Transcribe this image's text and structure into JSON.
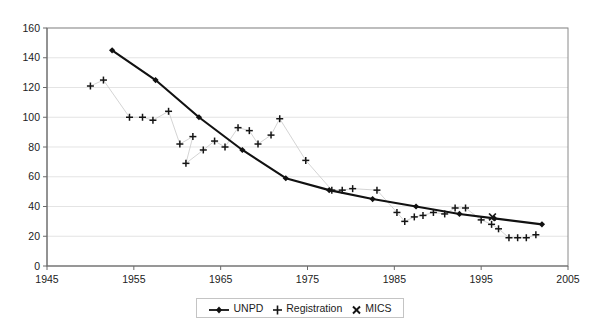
{
  "chart_data": {
    "type": "line",
    "title": "",
    "subtitle": "",
    "xlabel": "",
    "ylabel": "",
    "xlim": [
      1945,
      2005
    ],
    "ylim": [
      0,
      160
    ],
    "xticks": [
      1945,
      1955,
      1965,
      1975,
      1985,
      1995,
      2005
    ],
    "yticks": [
      0,
      20,
      40,
      60,
      80,
      100,
      120,
      140,
      160
    ],
    "grid": "horizontal",
    "legend_position": "bottom-center",
    "legend": [
      "UNPD",
      "Registration",
      "MICS"
    ],
    "series": [
      {
        "name": "UNPD",
        "marker": "diamond",
        "line": "solid-thick-black",
        "points": [
          {
            "x": 1952.5,
            "y": 145
          },
          {
            "x": 1957.5,
            "y": 125
          },
          {
            "x": 1962.5,
            "y": 100
          },
          {
            "x": 1967.5,
            "y": 78
          },
          {
            "x": 1972.5,
            "y": 59
          },
          {
            "x": 1977.5,
            "y": 51
          },
          {
            "x": 1982.5,
            "y": 45
          },
          {
            "x": 1987.5,
            "y": 40
          },
          {
            "x": 1992.5,
            "y": 35
          },
          {
            "x": 1996.5,
            "y": 32
          },
          {
            "x": 2002.0,
            "y": 28
          }
        ]
      },
      {
        "name": "Registration",
        "marker": "plus",
        "line": "solid-thin-grey",
        "points": [
          {
            "x": 1950.0,
            "y": 121
          },
          {
            "x": 1951.5,
            "y": 125
          },
          {
            "x": 1954.5,
            "y": 100
          },
          {
            "x": 1956.0,
            "y": 100
          },
          {
            "x": 1957.2,
            "y": 98
          },
          {
            "x": 1959.0,
            "y": 104
          },
          {
            "x": 1960.3,
            "y": 82
          },
          {
            "x": 1961.8,
            "y": 87
          },
          {
            "x": 1961.0,
            "y": 69
          },
          {
            "x": 1963.0,
            "y": 78
          },
          {
            "x": 1964.3,
            "y": 84
          },
          {
            "x": 1965.5,
            "y": 80
          },
          {
            "x": 1967.0,
            "y": 93
          },
          {
            "x": 1968.3,
            "y": 91
          },
          {
            "x": 1969.3,
            "y": 82
          },
          {
            "x": 1970.8,
            "y": 88
          },
          {
            "x": 1971.8,
            "y": 99
          },
          {
            "x": 1974.8,
            "y": 71
          },
          {
            "x": 1977.8,
            "y": 51
          },
          {
            "x": 1979.0,
            "y": 51
          },
          {
            "x": 1980.2,
            "y": 52
          },
          {
            "x": 1983.0,
            "y": 51
          },
          {
            "x": 1985.3,
            "y": 36
          },
          {
            "x": 1986.2,
            "y": 30
          },
          {
            "x": 1987.3,
            "y": 33
          },
          {
            "x": 1988.3,
            "y": 34
          },
          {
            "x": 1989.5,
            "y": 36
          },
          {
            "x": 1990.8,
            "y": 35
          },
          {
            "x": 1992.0,
            "y": 39
          },
          {
            "x": 1993.2,
            "y": 39
          },
          {
            "x": 1995.0,
            "y": 31
          },
          {
            "x": 1996.2,
            "y": 28
          },
          {
            "x": 1997.0,
            "y": 25
          },
          {
            "x": 1998.2,
            "y": 19
          },
          {
            "x": 1999.2,
            "y": 19
          },
          {
            "x": 2000.2,
            "y": 19
          },
          {
            "x": 2001.3,
            "y": 21
          }
        ]
      },
      {
        "name": "MICS",
        "marker": "cross",
        "line": "none",
        "points": [
          {
            "x": 1996.3,
            "y": 33
          }
        ]
      }
    ]
  },
  "legend": {
    "items": [
      {
        "label": "UNPD",
        "glyph": "line-diamond-marker"
      },
      {
        "label": "Registration",
        "glyph": "plus-marker"
      },
      {
        "label": "MICS",
        "glyph": "cross-marker"
      }
    ]
  },
  "colors": {
    "unpd": "#111111",
    "registration_marker": "#151515",
    "registration_line": "#c9c9c9",
    "mics": "#151515",
    "grid": "#d8d8d8",
    "axis": "#6b6b6b",
    "background": "#ffffff"
  }
}
